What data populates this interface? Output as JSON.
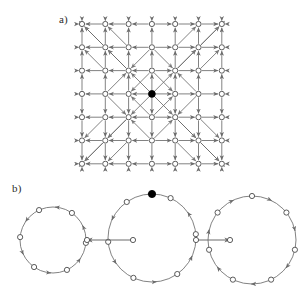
{
  "figure": {
    "title": "",
    "background": "#ffffff",
    "width": 305,
    "height": 291,
    "stroke_color": "#6b6b6b",
    "node_stroke": "#4a4a4a",
    "node_fill": "#ffffff",
    "marked_node_fill": "#000000"
  },
  "panels": [
    {
      "id": "a",
      "label": "a)",
      "x": 59,
      "y": 13
    },
    {
      "id": "b",
      "label": "b)",
      "x": 12,
      "y": 182
    }
  ],
  "panel_a": {
    "type": "directed-grid-graph",
    "rows": 7,
    "cols": 7,
    "origin_x": 82,
    "origin_y": 24,
    "spacing": 23.3,
    "node_radius": 2.6,
    "marked_node": {
      "row": 3,
      "col": 3,
      "label": "center"
    },
    "edge_orientation": "outward-from-center",
    "has_diagonals": true,
    "diagonal_description": "diagonal edges radiating outward from the central node forming nested diamond pattern",
    "border_outflow": true
  },
  "panel_b": {
    "type": "directed-cycle-chain",
    "circles": [
      {
        "id": "left",
        "cx": 53,
        "cy": 240,
        "r": 33,
        "nodes": 6,
        "direction": "counterclockwise",
        "marked_node_index": -1,
        "start_angle": -115
      },
      {
        "id": "middle",
        "cx": 152,
        "cy": 238,
        "r": 44,
        "nodes": 6,
        "direction": "counterclockwise",
        "marked_node_index": -1,
        "start_angle": -125,
        "extra_marked_top": true
      },
      {
        "id": "right",
        "cx": 252,
        "cy": 240,
        "r": 44,
        "nodes": 7,
        "direction": "clockwise",
        "marked_node_index": -1,
        "start_angle": -90
      }
    ],
    "connectors": [
      {
        "id": "left-connector",
        "from_x": 133,
        "to_x": 87,
        "y": 240,
        "direction": "left",
        "arrow": "←"
      },
      {
        "id": "right-connector",
        "from_x": 196,
        "to_x": 230,
        "y": 240,
        "direction": "right",
        "arrow": "→"
      }
    ],
    "marked_node": {
      "circle": "middle",
      "position": "top",
      "x": 152,
      "y": 194
    }
  }
}
